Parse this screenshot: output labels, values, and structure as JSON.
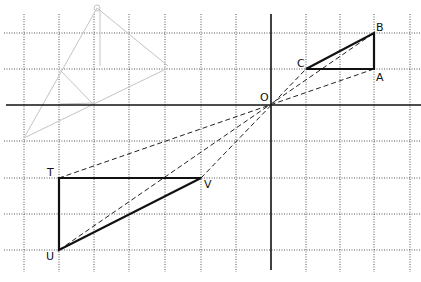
{
  "figure": {
    "width": 421,
    "height": 282,
    "grid": {
      "xs": [
        24,
        59,
        94,
        129,
        165,
        201,
        236,
        306,
        340,
        374,
        410
      ],
      "ys": [
        33,
        69,
        141,
        178,
        214,
        250
      ],
      "color": "#555555"
    },
    "axes": {
      "origin": {
        "x": 271,
        "y": 105
      },
      "x_axis": {
        "x1": 6,
        "x2": 421,
        "y": 105
      },
      "y_axis": {
        "x": 271,
        "y1": 14,
        "y2": 270
      },
      "origin_label": "O"
    },
    "points": {
      "A": {
        "x": 374,
        "y": 69,
        "label": "A"
      },
      "B": {
        "x": 374,
        "y": 33,
        "label": "B"
      },
      "C": {
        "x": 306,
        "y": 69,
        "label": "C"
      },
      "T": {
        "x": 59,
        "y": 178,
        "label": "T"
      },
      "U": {
        "x": 59,
        "y": 250,
        "label": "U"
      },
      "V": {
        "x": 201,
        "y": 178,
        "label": "V"
      }
    },
    "triangles": [
      {
        "name": "ABC",
        "vertices": [
          "A",
          "B",
          "C"
        ]
      },
      {
        "name": "TUV",
        "vertices": [
          "T",
          "U",
          "V"
        ]
      }
    ],
    "dashed_rays": [
      {
        "from": "T",
        "to": "A"
      },
      {
        "from": "U",
        "to": "B"
      },
      {
        "from": "V",
        "to": "C"
      }
    ],
    "faint_sketch_color": "#c8c8c8"
  }
}
